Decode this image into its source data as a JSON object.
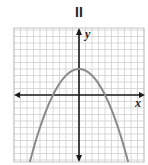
{
  "figure": {
    "title": "II",
    "x_label": "x",
    "y_label": "y"
  },
  "chart_data": {
    "type": "line",
    "title": "II",
    "xlabel": "x",
    "ylabel": "y",
    "function": "y = 4 - x^2/4 (downward-opening parabola)",
    "vertex": [
      0,
      4
    ],
    "x_intercepts": [
      -4,
      4
    ],
    "xlim": [
      -10,
      10
    ],
    "ylim": [
      -10,
      10
    ],
    "grid": true,
    "series": [
      {
        "name": "parabola",
        "x": [
          -9,
          -8,
          -6,
          -4,
          -2,
          0,
          2,
          4,
          6,
          8,
          9
        ],
        "y": [
          -16.25,
          -12,
          -5,
          0,
          3,
          4,
          3,
          0,
          -5,
          -12,
          -16.25
        ]
      }
    ],
    "colors": {
      "curve": "#8a8a8a",
      "axes": "#1a1a1a",
      "grid": "#c8c8c8"
    }
  }
}
